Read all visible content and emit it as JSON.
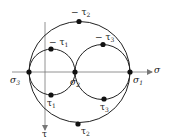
{
  "diagram": {
    "type": "mohr-circle",
    "axes": {
      "sigma_label": "σ",
      "tau_label": "τ"
    },
    "colors": {
      "stroke": "#222222",
      "axis": "#777777",
      "background": "#ffffff"
    },
    "labels": {
      "sigma3": {
        "base": "σ",
        "sub": "3"
      },
      "sigma2": {
        "base": "σ",
        "sub": "2"
      },
      "sigma1": {
        "base": "σ",
        "sub": "1"
      },
      "neg_tau1": {
        "base": "− τ",
        "sub": "1"
      },
      "tau1": {
        "base": "τ",
        "sub": "1"
      },
      "neg_tau2": {
        "base": "− τ",
        "sub": "2"
      },
      "tau2": {
        "base": "τ",
        "sub": "2"
      },
      "neg_tau3": {
        "base": "− τ",
        "sub": "3"
      },
      "tau3": {
        "base": "τ",
        "sub": "3"
      }
    }
  }
}
